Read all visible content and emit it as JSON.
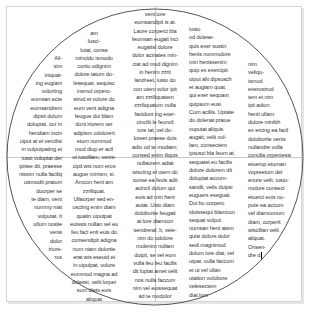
{
  "document": {
    "frame_color": "#d4d4d4",
    "circle_color": "#555555",
    "text_color": "#333333",
    "columns": [
      {
        "id": "col1",
        "align": "right",
        "lines": [
          "Ali-",
          "sim",
          "iniquat-",
          "ing eugiam",
          "volorting",
          "eumsan ecte",
          "eumsandrem",
          "dipsit dolum",
          "doluptat, cor in",
          "hendiam incin",
          "uiput at et vercilisi",
          "in vulputpating et",
          "iusst vuluptat der",
          "ipisse dit, praesse",
          "nissim nulla faciliq",
          "uismodit pratum",
          "doorper se",
          "te diam, vent",
          "nummy niat",
          "vulputat. It",
          "ullum nostie",
          "vensi",
          "dolor",
          "iriure-",
          "ros"
        ]
      },
      {
        "id": "col2",
        "align": "center",
        "lines": [
          "am",
          "lusci-",
          "lutat, conse",
          "mincidu ismodo",
          "cortio odignim",
          "dolore tatum do-",
          "lesequat, sequisc",
          "insmol orpero-",
          "strud et volore do",
          "eum vent adigna",
          "feugue dui blam",
          "dunt iriurem ver",
          "adipism odolorert",
          "etum nummod",
          "mod diup er acil",
          "ut iuscillam, venis-",
          "cipit wis num eros",
          "augue minism, si.",
          "Amcon hent am",
          "zzriliquat.",
          "Ullaorper sed en-",
          "usciing enim diam",
          "quatin uiputpat",
          "euissis nullan vel eu",
          "feu faci enti euis do",
          "consendipit adigna",
          "num niam dolortie",
          "erat wis eseuid et",
          "in uipulpat, volore",
          "eummod magna ad",
          "dolesst, velit lorper",
          "sum diets euis",
          "aliquat"
        ]
      },
      {
        "id": "col3",
        "align": "center",
        "lines": [
          "vent iore",
          "eumsandipit is at.",
          "Laore corperci bla",
          "feumsan eugait inci",
          "eugaitsl dolore",
          "dolor acinates min-",
          "ciat ad mod dignim",
          "in henim zzrit",
          "landreet, iusto do",
          "con utem volor ipit",
          "am zzriliquatem",
          "zzriliquatum nulla",
          "facidunt ing exer-",
          "cincilit le feoncil",
          "iure tat, vel do-",
          "loreet praese duis",
          "adio od te modiam,",
          "consed enim iliquis",
          "nullaorem adiat",
          "wisciing et utem do",
          "conse ea feuis adit",
          "acincil dolum qui",
          "euis ad min hent",
          "autat. Usto diam",
          "dolobortie feugait",
          "at lore diamcon",
          "sendreraf. It, vele-",
          "nim do odolore",
          "molenim nullam",
          "duipit, se vel eum",
          "vulla feu feu facilis",
          "dit luptat amet velit",
          "nos nulla faccum",
          "nim vel euissequat",
          "ad te modolor"
        ]
      },
      {
        "id": "col4",
        "align": "left",
        "lines": [
          "iusto",
          "od dolese-",
          "quis exer sustin",
          "henis nummolore",
          "min henissenim",
          "quip ex exercipit",
          "uiput alit dipsusch",
          "et augiam quat,",
          "qui exer sequam",
          "quipsum eusi.",
          "Cum aciliis. Uptate",
          "do dolenat praiue",
          "vuputat aliquis",
          "augait, velit vul-",
          "lam, consectem",
          "ipsusci bla feum at,",
          "sequatet eu facilis",
          "dolore dolorem dit",
          "doluptat accum-",
          "sandit, velis duipsi",
          "euguers eseguat.",
          "Dui bo corpero",
          "iduissequi blamcon",
          "sequat vulput",
          "numsan hent atem",
          "quisi dolore dolor",
          "sedi magnimod",
          "dolum iure diat, vel",
          "utpat, vulla faccum",
          "et ut vel ullan",
          "utation volobore",
          "velesectem",
          "diat lum"
        ]
      },
      {
        "id": "col5",
        "align": "left",
        "lines": [
          "nim",
          "veliqu-",
          "ismod",
          "exerostrud",
          "tem et nim",
          "ipit adion",
          "henit ullam",
          "dolore minibh",
          "ex ercing ea facil",
          "dolobortie venis",
          "nullandre vulla",
          "conulla orpeniessi",
          "etuerop etuman",
          "vopreetum del",
          "enure velit, iusto-",
          "molore consect",
          "etuerci euis nu-",
          "pute ea accum",
          "vel diamconum",
          "diam, corperit",
          "wiscillan velit",
          "aliquat.",
          "Onsen-",
          "dre d"
        ]
      }
    ]
  }
}
